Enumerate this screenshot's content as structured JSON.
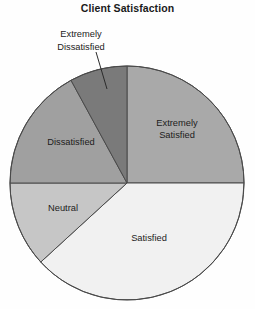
{
  "chart_data": {
    "type": "pie",
    "title": "Client Satisfaction",
    "subtitle": "",
    "xlabel": "",
    "ylabel": "",
    "legend_position": "none",
    "grid": false,
    "labels_placement": "inside-slices-with-leader-for-small-slice",
    "start_angle_deg": 0,
    "direction": "clockwise",
    "categories": [
      "Extremely Satisfied",
      "Satisfied",
      "Neutral",
      "Dissatisfied",
      "Extremely Dissatisfied"
    ],
    "values": [
      25,
      38,
      12,
      17,
      8
    ],
    "slices": [
      {
        "label": "Extremely Satisfied",
        "value": 25,
        "start_deg": 0,
        "end_deg": 90,
        "color": "#a9a9a9",
        "label_lines": "Extremely\nSatisfied"
      },
      {
        "label": "Satisfied",
        "value": 38,
        "start_deg": 90,
        "end_deg": 227.5,
        "color": "#f1f1f1",
        "label_lines": "Satisfied"
      },
      {
        "label": "Neutral",
        "value": 12,
        "start_deg": 227.5,
        "end_deg": 270,
        "color": "#c6c6c6",
        "label_lines": "Neutral"
      },
      {
        "label": "Dissatisfied",
        "value": 17,
        "start_deg": 270,
        "end_deg": 331.4,
        "color": "#a0a0a0",
        "label_lines": "Dissatisfied"
      },
      {
        "label": "Extremely Dissatisfied",
        "value": 8,
        "start_deg": 331.4,
        "end_deg": 360,
        "color": "#7a7a7a",
        "label_lines": "Extremely\nDissatisfied"
      }
    ]
  },
  "figure": {
    "title": "Client Satisfaction",
    "background_color": "#fefefe",
    "outline_color": "#4a4a4a",
    "text_color": "#1c1c1c"
  },
  "labels": {
    "extremely_satisfied": "Extremely\nSatisfied",
    "satisfied": "Satisfied",
    "neutral": "Neutral",
    "dissatisfied": "Dissatisfied",
    "extremely_dissatisfied": "Extremely\nDissatisfied"
  }
}
